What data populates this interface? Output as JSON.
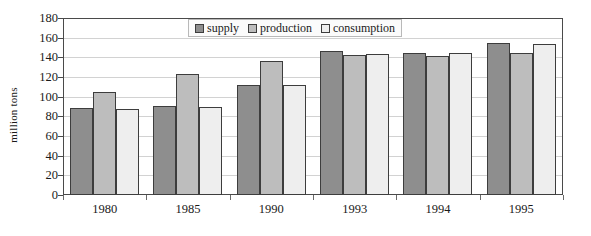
{
  "chart_data": {
    "type": "bar",
    "title": "",
    "xlabel": "",
    "ylabel": "million tons",
    "ylim": [
      0,
      180
    ],
    "ytick_step": 20,
    "yticks": [
      180,
      160,
      140,
      120,
      100,
      80,
      60,
      40,
      20,
      0
    ],
    "grid": true,
    "legend_position": "top-center",
    "categories": [
      "1980",
      "1985",
      "1990",
      "1993",
      "1994",
      "1995"
    ],
    "series": [
      {
        "name": "supply",
        "color": "#8e8e8e",
        "values": [
          88,
          91,
          112,
          146,
          144,
          155
        ]
      },
      {
        "name": "production",
        "color": "#bdbdbd",
        "values": [
          105,
          123,
          136,
          142,
          141,
          144
        ]
      },
      {
        "name": "consumption",
        "color": "#eeeeee",
        "values": [
          87,
          90,
          112,
          143,
          144,
          154
        ]
      }
    ]
  },
  "axes": {
    "y_title": "million tons"
  },
  "colors": {
    "supply": "#8e8e8e",
    "production": "#bdbdbd",
    "consumption": "#eeeeee",
    "bar_border": "#3d3d3d",
    "frame": "#4a4a4a",
    "gridline": "#d2d2d2",
    "background": "#ffffff"
  }
}
